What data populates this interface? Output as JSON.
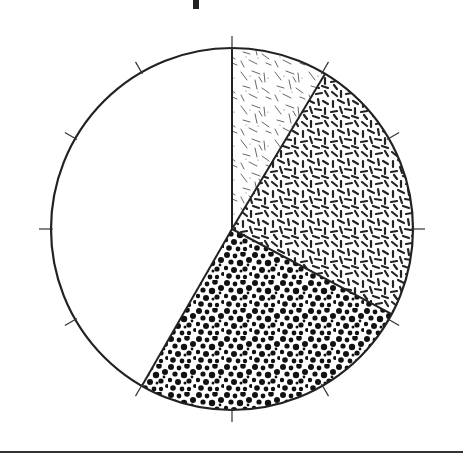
{
  "chart_data": {
    "type": "pie",
    "title": "",
    "title_visible": false,
    "start_angle_deg": 0,
    "direction": "clockwise",
    "slices": [
      {
        "label": "",
        "value": 8.6,
        "pattern": "sparse-lines",
        "fill": "#ffffff",
        "ink": "#555555"
      },
      {
        "label": "",
        "value": 24.2,
        "pattern": "dense-dashes",
        "fill": "#ffffff",
        "ink": "#222222"
      },
      {
        "label": "",
        "value": 25.5,
        "pattern": "dots",
        "fill": "#ffffff",
        "ink": "#111111"
      },
      {
        "label": "",
        "value": 41.7,
        "pattern": "none",
        "fill": "#ffffff",
        "ink": "#222222"
      }
    ],
    "ticks": {
      "count": 12,
      "interval_deg": 30,
      "placement": "outside"
    },
    "legend": null,
    "outline_color": "#222222",
    "background": "#ffffff"
  }
}
